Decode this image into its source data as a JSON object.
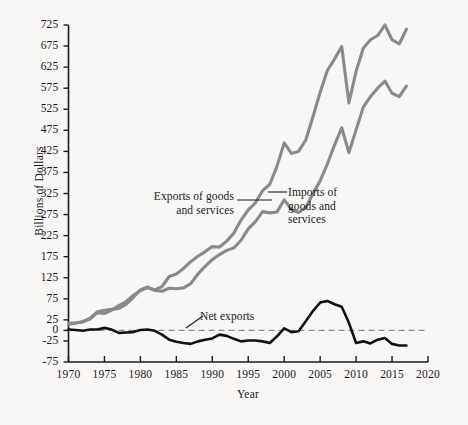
{
  "chart_data": {
    "type": "line",
    "title": "",
    "xlabel": "Year",
    "ylabel": "Billions of Dollars",
    "xlim": [
      1970,
      2020
    ],
    "ylim": [
      -75,
      725
    ],
    "grid": false,
    "legend_position": "inline-annotations",
    "yticks": [
      -75,
      -25,
      0,
      25,
      75,
      125,
      175,
      225,
      275,
      325,
      375,
      425,
      475,
      525,
      575,
      625,
      675,
      725
    ],
    "xticks": [
      1970,
      1975,
      1980,
      1985,
      1990,
      1995,
      2000,
      2005,
      2010,
      2015,
      2020
    ],
    "zero_reference_line": 0,
    "colors": {
      "exports": "#8a8a8a",
      "imports": "#8a8a8a",
      "net_exports": "#111111",
      "zero_line": "#8a8a8a",
      "axis": "#1a1a1a",
      "background": "#f8f7f5"
    },
    "x": [
      1970,
      1971,
      1972,
      1973,
      1974,
      1975,
      1976,
      1977,
      1978,
      1979,
      1980,
      1981,
      1982,
      1983,
      1984,
      1985,
      1986,
      1987,
      1988,
      1989,
      1990,
      1991,
      1992,
      1993,
      1994,
      1995,
      1996,
      1997,
      1998,
      1999,
      2000,
      2001,
      2002,
      2003,
      2004,
      2005,
      2006,
      2007,
      2008,
      2009,
      2010,
      2011,
      2012,
      2013,
      2014,
      2015,
      2016,
      2017
    ],
    "series": [
      {
        "name": "Exports of goods and services",
        "label": "Exports of goods and services",
        "values": [
          17,
          18,
          20,
          29,
          44,
          48,
          50,
          52,
          62,
          78,
          96,
          103,
          95,
          93,
          100,
          99,
          101,
          111,
          134,
          152,
          168,
          180,
          190,
          196,
          214,
          241,
          258,
          282,
          279,
          281,
          310,
          287,
          280,
          291,
          325,
          355,
          395,
          440,
          481,
          422,
          476,
          530,
          555,
          575,
          592,
          563,
          555,
          580
        ],
        "color": "#8a8a8a"
      },
      {
        "name": "Imports of goods and services",
        "label": "Imports of goods and services",
        "values": [
          15,
          17,
          21,
          27,
          42,
          40,
          48,
          59,
          68,
          83,
          95,
          101,
          96,
          104,
          128,
          134,
          147,
          163,
          176,
          187,
          199,
          198,
          212,
          231,
          262,
          286,
          303,
          332,
          347,
          390,
          445,
          420,
          425,
          452,
          507,
          565,
          617,
          644,
          674,
          540,
          615,
          670,
          690,
          700,
          725,
          690,
          680,
          715
        ],
        "color": "#8a8a8a"
      },
      {
        "name": "Net exports",
        "label": "Net exports",
        "values": [
          2,
          1,
          -1,
          2,
          2,
          8,
          2,
          -7,
          -6,
          -5,
          1,
          2,
          -1,
          -11,
          -28,
          -35,
          -46,
          -52,
          -42,
          -35,
          -31,
          -18,
          -22,
          -35,
          -48,
          -45,
          -45,
          -50,
          -68,
          -109,
          -135,
          -133,
          -145,
          -161,
          -182,
          -210,
          -222,
          -204,
          -193,
          -118,
          -139,
          -140,
          -135,
          -125,
          -133,
          -127,
          -125,
          -135
        ],
        "display_values": [
          2,
          1,
          -1,
          2,
          2,
          6,
          2,
          -6,
          -5,
          -4,
          1,
          2,
          -1,
          -10,
          -22,
          -27,
          -30,
          -32,
          -26,
          -22,
          -19,
          -10,
          -13,
          -20,
          -26,
          -24,
          -24,
          -26,
          -30,
          -14,
          5,
          -4,
          -2,
          22,
          46,
          66,
          70,
          62,
          56,
          18,
          -30,
          -26,
          -31,
          -22,
          -18,
          -32,
          -36,
          -36
        ],
        "color": "#111111"
      }
    ],
    "annotations": [
      {
        "text": "Exports of goods and services",
        "target_series": "Exports of goods and services"
      },
      {
        "text": "Imports of goods and services",
        "target_series": "Imports of goods and services"
      },
      {
        "text": "Net exports",
        "target_series": "Net exports"
      }
    ]
  },
  "axes": {
    "y_tick_labels": [
      "725",
      "675",
      "625",
      "575",
      "525",
      "475",
      "425",
      "375",
      "325",
      "275",
      "225",
      "175",
      "125",
      "75",
      "25",
      "0",
      "-25",
      "-75"
    ],
    "x_tick_labels": [
      "1970",
      "1975",
      "1980",
      "1985",
      "1990",
      "1995",
      "2000",
      "2005",
      "2010",
      "2015",
      "2020"
    ],
    "y_axis_title": "Billions of Dollars",
    "x_axis_title": "Year"
  },
  "labels": {
    "exports_line1": "Exports of goods",
    "exports_line2": "and services",
    "imports_line1": "Imports of",
    "imports_line2": "goods and",
    "imports_line3": "services",
    "net_exports": "Net exports"
  }
}
